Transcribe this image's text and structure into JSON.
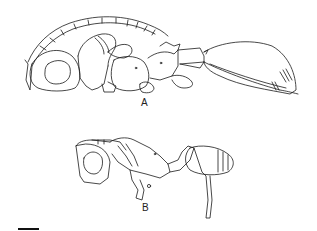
{
  "figure": {
    "panels": [
      {
        "id": "A",
        "label": "A",
        "subject": "insect lateral view (large specimen)"
      },
      {
        "id": "B",
        "label": "B",
        "subject": "insect lateral view (small specimen)"
      }
    ],
    "scale_bar": {
      "visible": true,
      "label": ""
    },
    "colors": {
      "line": "#1a1a1a",
      "background": "#ffffff"
    }
  }
}
